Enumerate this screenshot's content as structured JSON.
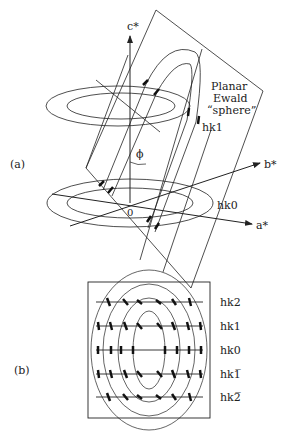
{
  "panel_a": {
    "label": "(a)",
    "axes": {
      "c": "c*",
      "b": "b*",
      "a": "a*",
      "origin": "0"
    },
    "angle": "ϕ",
    "ewald_label": [
      "Planar",
      "Ewald",
      "“sphere”"
    ],
    "layers": {
      "upper": "hk1",
      "lower": "hk0"
    }
  },
  "panel_b": {
    "label": "(b)",
    "rows": [
      {
        "label": "hk2"
      },
      {
        "label": "hk1"
      },
      {
        "label": "hk0"
      },
      {
        "label": "hk1̅"
      },
      {
        "label": "hk2̅"
      }
    ]
  }
}
